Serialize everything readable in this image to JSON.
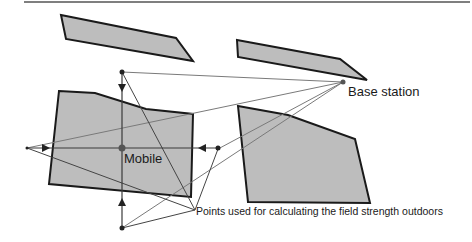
{
  "figure": {
    "labels": {
      "base_station": "Base station",
      "mobile": "Mobile",
      "points": "Points used for calculating the field strength outdoors"
    },
    "colors": {
      "building_fill": "#bdbdbd",
      "building_stroke": "#1a1a1a",
      "ray": "#7a7a7a",
      "axis_line": "#3a3a3a",
      "point": "#222222",
      "mobile_point": "#555555",
      "top_rule": "#555555"
    },
    "buildings": [
      {
        "name": "building-top-left"
      },
      {
        "name": "building-top-right"
      },
      {
        "name": "building-mobile"
      },
      {
        "name": "building-right"
      }
    ],
    "points": [
      "top",
      "left",
      "right",
      "bottom"
    ]
  }
}
